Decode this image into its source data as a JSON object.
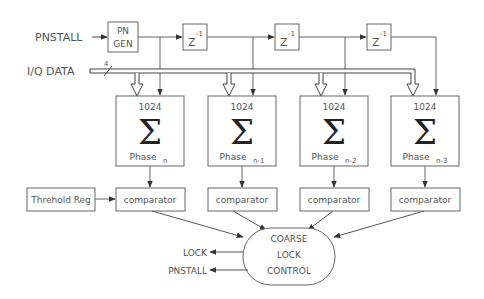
{
  "inputs": {
    "pnstall_in": "PNSTALL",
    "iq_data": "I/Q DATA",
    "bus_width": "4"
  },
  "pn_gen": {
    "line1": "PN",
    "line2": "GEN"
  },
  "delays": [
    {
      "base": "Z",
      "exp": "-1"
    },
    {
      "base": "Z",
      "exp": "-1"
    },
    {
      "base": "Z",
      "exp": "-1"
    }
  ],
  "accumulators": [
    {
      "count": "1024",
      "symbol": "Σ",
      "phase": "Phase",
      "sub": "n"
    },
    {
      "count": "1024",
      "symbol": "Σ",
      "phase": "Phase",
      "sub": "n-1"
    },
    {
      "count": "1024",
      "symbol": "Σ",
      "phase": "Phase",
      "sub": "n-2"
    },
    {
      "count": "1024",
      "symbol": "Σ",
      "phase": "Phase",
      "sub": "n-3"
    }
  ],
  "threshold_reg": "Threhold Reg",
  "comparators": [
    "comparator",
    "comparator",
    "comparator",
    "comparator"
  ],
  "control": {
    "line1": "COARSE",
    "line2": "LOCK",
    "line3": "CONTROL"
  },
  "outputs": {
    "lock": "LOCK",
    "pnstall_out": "PNSTALL"
  }
}
